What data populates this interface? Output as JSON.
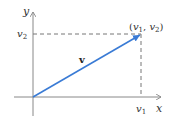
{
  "diagram": {
    "axes": {
      "x_label": "x",
      "y_label": "y"
    },
    "vector": {
      "label": "v",
      "color": "#3a7bd5",
      "from": "origin",
      "to_label": "(v1, v2)"
    },
    "components": {
      "v1_label": "v",
      "v1_sub": "1",
      "v2_label": "v",
      "v2_sub": "2"
    },
    "point": {
      "open": "(",
      "v1": "v",
      "v1_sub": "1",
      "sep": ", ",
      "v2": "v",
      "v2_sub": "2",
      "close": ")"
    },
    "colors": {
      "axis": "#888888",
      "dash": "#777777",
      "vector": "#3a7bd5",
      "text": "#333333"
    }
  }
}
